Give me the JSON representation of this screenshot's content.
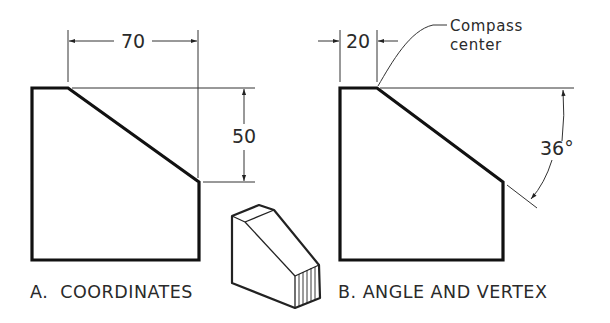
{
  "colors": {
    "background": "#ffffff",
    "ink": "#1a1a1a",
    "thin_line": "#333333"
  },
  "figure_a": {
    "caption": "A.  COORDINATES",
    "dimensions": {
      "horizontal": "70",
      "vertical": "50"
    }
  },
  "figure_b": {
    "caption": "B. ANGLE AND VERTEX",
    "dimensions": {
      "horizontal": "20",
      "angle": "36°"
    },
    "note_line1": "Compass",
    "note_line2": "center"
  },
  "pictorial": {
    "description": "isometric view of chamfered block"
  }
}
